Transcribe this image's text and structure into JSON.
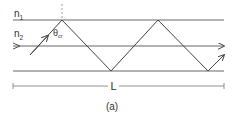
{
  "diagram": {
    "type": "optical-fiber-total-internal-reflection",
    "labels": {
      "n1": "n",
      "n1_sub": "1",
      "n2": "n",
      "n2_sub": "2",
      "theta": "θ",
      "theta_sub": "cr",
      "length": "L",
      "caption": "(a)"
    },
    "colors": {
      "line": "#555555",
      "ray": "#444444",
      "text": "#333333"
    },
    "geometry": {
      "top_boundary_y": 20,
      "axis_y": 46,
      "bottom_boundary_y": 71,
      "x_start": 13,
      "x_end": 224,
      "ray_points": [
        [
          30,
          55
        ],
        [
          62,
          20
        ],
        [
          111,
          71
        ],
        [
          158,
          20
        ],
        [
          208,
          71
        ],
        [
          224,
          55
        ]
      ],
      "normal_x": 62,
      "dimension_y": 86
    }
  }
}
